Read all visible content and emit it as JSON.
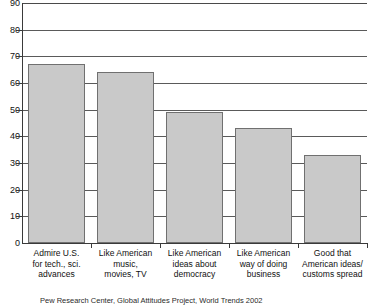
{
  "chart_data": {
    "type": "bar",
    "title": "",
    "subtitle": "",
    "xlabel": "",
    "ylabel": "",
    "ylim": [
      0,
      90
    ],
    "ytick_step": 10,
    "grid": true,
    "legend": false,
    "bar_fill_color": "#c9c9c9",
    "bar_border_color": "#707070",
    "categories": [
      "Admire U.S. for tech., sci. advances",
      "Like American music, movies, TV",
      "Like American ideas about democracy",
      "Like American way of doing business",
      "Good that American ideas/ customs spread"
    ],
    "category_lines": [
      [
        "Admire U.S.",
        "for tech., sci.",
        "advances"
      ],
      [
        "Like American",
        "music,",
        "movies, TV"
      ],
      [
        "Like American",
        "ideas about",
        "democracy"
      ],
      [
        "Like American",
        "way of doing",
        "business"
      ],
      [
        "Good that",
        "American ideas/",
        "customs spread"
      ]
    ],
    "values": [
      67,
      64,
      49,
      43,
      33
    ],
    "ytick_labels": [
      "0",
      "10",
      "20",
      "30",
      "40",
      "50",
      "60",
      "70",
      "80",
      "90"
    ],
    "ytick_values": [
      0,
      10,
      20,
      30,
      40,
      50,
      60,
      70,
      80,
      90
    ]
  },
  "source_note": "Pew Research Center, Global Attitudes Project, World Trends 2002"
}
